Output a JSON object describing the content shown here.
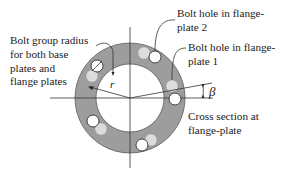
{
  "diagram": {
    "title": "Cross section at flange-plate",
    "labels": {
      "bolt_group_radius": [
        "Bolt group radius",
        "for both base",
        "plates and",
        "flange plates"
      ],
      "bolt_hole_plate2": [
        "Bolt hole in flange-",
        "plate 2"
      ],
      "bolt_hole_plate1": [
        "Bolt hole in flange-",
        "plate 1"
      ],
      "cross_section": [
        "Cross section at",
        "flange-plate"
      ]
    },
    "symbols": {
      "radius": "r",
      "angle": "β"
    },
    "colors": {
      "ring_fill": "#9d9d9d",
      "ring_stroke": "#555555",
      "hole_plate2_fill": "#ffffff",
      "hole_plate1_fill": "#d9d9d9",
      "line": "#333333",
      "background": "#ffffff"
    },
    "geometry": {
      "center": [
        130,
        98
      ],
      "outer_radius": 55,
      "inner_radius": 34,
      "bolt_circle_radius": 45
    }
  }
}
